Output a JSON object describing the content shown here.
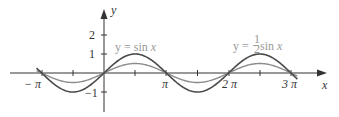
{
  "chart_data": {
    "type": "line",
    "title": "",
    "xlabel": "x",
    "ylabel": "y",
    "xlim": [
      -3.45,
      3.55
    ],
    "ylim": [
      -1.5,
      2.8
    ],
    "grid": false,
    "x_ticks": [
      -3.14159,
      -1.5708,
      0,
      1.5708,
      3.14159,
      4.7124,
      6.28318,
      7.854,
      9.42478
    ],
    "x_tick_labels": [
      "−π",
      "",
      "",
      "",
      "π",
      "",
      "2π",
      "",
      "3π"
    ],
    "y_ticks": [
      -1,
      1,
      2
    ],
    "y_tick_labels": [
      "−1",
      "1",
      "2"
    ],
    "series": [
      {
        "name": "y = sin x",
        "function": "sin(x)",
        "color": "#4a4a4a",
        "x_range": [
          -3.4,
          9.75
        ]
      },
      {
        "name": "y = ½ sin x",
        "function": "0.5*sin(x)",
        "color": "#8c8c8c",
        "x_range": [
          -3.4,
          9.75
        ]
      }
    ],
    "annotations": [
      {
        "text": "y = sin x",
        "near": "upper left of first positive hump"
      },
      {
        "text": "y = ½ sin x",
        "near": "above hump between 2π and 3π"
      }
    ]
  },
  "labels": {
    "y_axis": "y",
    "x_axis": "x",
    "tick_2": "2",
    "tick_1": "1",
    "tick_m1": "−1",
    "neg_pi": "− π",
    "pi": "π",
    "two_pi": "2 π",
    "three_pi": "3 π",
    "sin_label_prefix": "y = sin ",
    "sin_label_var": "x",
    "half_label_prefix": "y = ",
    "half_num": "1",
    "half_den": "2",
    "half_label_suffix": " sin ",
    "half_label_var": "x"
  }
}
